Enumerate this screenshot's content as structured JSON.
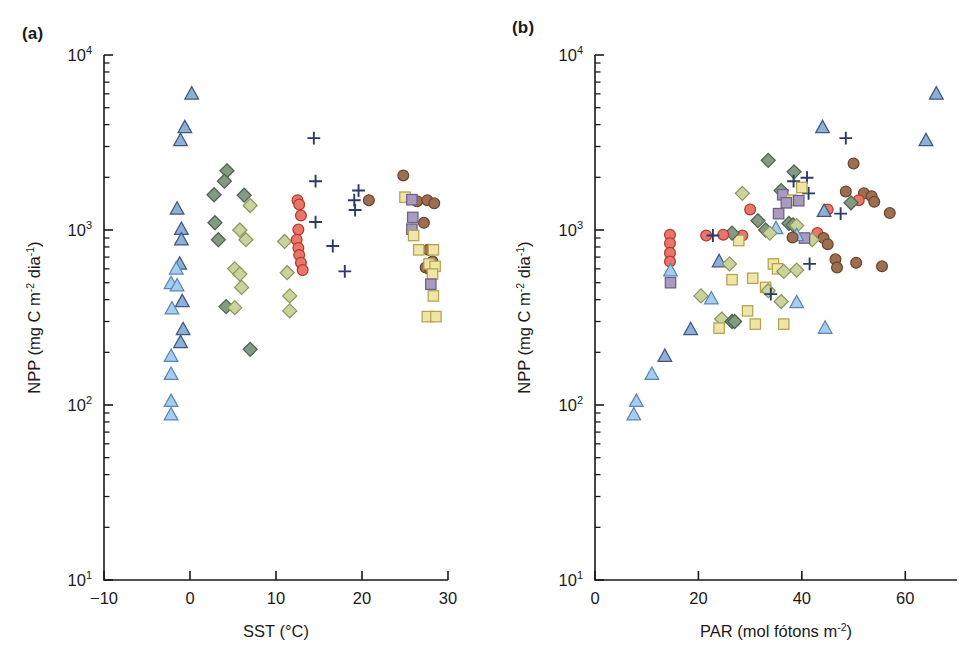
{
  "figure": {
    "background": "#ffffff",
    "panels": [
      {
        "id": "a",
        "label": "(a)"
      },
      {
        "id": "b",
        "label": "(b)"
      }
    ]
  },
  "marker_styles": {
    "triangle_light": {
      "name": "light-blue-triangle",
      "shape": "triangle",
      "fill": "#a5cdee",
      "stroke": "#5d86b5"
    },
    "triangle_dark": {
      "name": "steel-blue-triangle",
      "shape": "triangle",
      "fill": "#8fb0d6",
      "stroke": "#40587f"
    },
    "diamond_olive": {
      "name": "olive-diamond",
      "shape": "diamond",
      "fill": "#ccd39a",
      "stroke": "#8f9560"
    },
    "diamond_green": {
      "name": "dark-green-diamond",
      "shape": "diamond",
      "fill": "#849a82",
      "stroke": "#4d6450"
    },
    "circle_red": {
      "name": "red-circle",
      "shape": "circle",
      "fill": "#e8766a",
      "stroke": "#b03b2e"
    },
    "circle_brown": {
      "name": "brown-circle",
      "shape": "circle",
      "fill": "#9c6f52",
      "stroke": "#6b452d"
    },
    "square_yellow": {
      "name": "yellow-square",
      "shape": "square",
      "fill": "#eee5a6",
      "stroke": "#b3a martial"
    },
    "square_purple": {
      "name": "purple-square",
      "shape": "square",
      "fill": "#a99bc0",
      "stroke": "#6d5f86"
    },
    "plus_navy": {
      "name": "navy-plus",
      "shape": "plus",
      "fill": "none",
      "stroke": "#2b3a66"
    }
  },
  "chart_data": [
    {
      "id": "a",
      "type": "scatter",
      "title": "",
      "panel_label": "(a)",
      "xlabel": "SST (°C)",
      "xlabel_parts": {
        "text": "SST (",
        "unit": "°C",
        "close": ")"
      },
      "ylabel": "NPP (mg C m⁻² dia⁻¹)",
      "ylabel_parts": {
        "lead": "NPP (mg C m",
        "sup1": "-2",
        "mid": " dia",
        "sup2": "-1",
        "close": ")"
      },
      "xlim": [
        -10,
        30
      ],
      "ylim": [
        10,
        10000
      ],
      "yscale": "log",
      "xticks": [
        -10,
        0,
        10,
        20,
        30
      ],
      "xticklabels": [
        "−10",
        "0",
        "10",
        "20",
        "30"
      ],
      "yticks": [
        10,
        100,
        1000,
        10000
      ],
      "yticklabels": [
        "10¹",
        "10²",
        "10³",
        "10⁴"
      ],
      "yticklabel_parts": [
        {
          "base": "10",
          "exp": "1"
        },
        {
          "base": "10",
          "exp": "2"
        },
        {
          "base": "10",
          "exp": "3"
        },
        {
          "base": "10",
          "exp": "4"
        }
      ],
      "grid": false,
      "legend": false,
      "points": [
        {
          "x": 0.2,
          "y": 6000,
          "m": "triangle_dark"
        },
        {
          "x": -0.6,
          "y": 3850,
          "m": "triangle_dark"
        },
        {
          "x": -1.1,
          "y": 3250,
          "m": "triangle_dark"
        },
        {
          "x": -1.5,
          "y": 1320,
          "m": "triangle_dark"
        },
        {
          "x": -1.0,
          "y": 1010,
          "m": "triangle_dark"
        },
        {
          "x": -1.0,
          "y": 880,
          "m": "triangle_dark"
        },
        {
          "x": -1.2,
          "y": 640,
          "m": "triangle_dark"
        },
        {
          "x": -1.6,
          "y": 600,
          "m": "triangle_light"
        },
        {
          "x": -2.2,
          "y": 495,
          "m": "triangle_light"
        },
        {
          "x": -1.5,
          "y": 480,
          "m": "triangle_light"
        },
        {
          "x": -0.9,
          "y": 390,
          "m": "triangle_dark"
        },
        {
          "x": -2.1,
          "y": 355,
          "m": "triangle_light"
        },
        {
          "x": -0.8,
          "y": 270,
          "m": "triangle_dark"
        },
        {
          "x": -1.1,
          "y": 228,
          "m": "triangle_dark"
        },
        {
          "x": -2.2,
          "y": 190,
          "m": "triangle_light"
        },
        {
          "x": -2.2,
          "y": 150,
          "m": "triangle_light"
        },
        {
          "x": -2.2,
          "y": 105,
          "m": "triangle_light"
        },
        {
          "x": -2.2,
          "y": 88,
          "m": "triangle_light"
        },
        {
          "x": 4.3,
          "y": 2180,
          "m": "diamond_green"
        },
        {
          "x": 4.0,
          "y": 1900,
          "m": "diamond_green"
        },
        {
          "x": 2.8,
          "y": 1590,
          "m": "diamond_green"
        },
        {
          "x": 6.3,
          "y": 1580,
          "m": "diamond_green"
        },
        {
          "x": 7.0,
          "y": 1380,
          "m": "diamond_olive"
        },
        {
          "x": 2.9,
          "y": 1100,
          "m": "diamond_green"
        },
        {
          "x": 5.8,
          "y": 1000,
          "m": "diamond_olive"
        },
        {
          "x": 3.3,
          "y": 880,
          "m": "diamond_green"
        },
        {
          "x": 6.5,
          "y": 880,
          "m": "diamond_olive"
        },
        {
          "x": 5.2,
          "y": 600,
          "m": "diamond_olive"
        },
        {
          "x": 5.8,
          "y": 560,
          "m": "diamond_olive"
        },
        {
          "x": 6.0,
          "y": 470,
          "m": "diamond_olive"
        },
        {
          "x": 4.2,
          "y": 365,
          "m": "diamond_green"
        },
        {
          "x": 5.2,
          "y": 360,
          "m": "diamond_olive"
        },
        {
          "x": 7.0,
          "y": 208,
          "m": "diamond_green"
        },
        {
          "x": 11.0,
          "y": 860,
          "m": "diamond_olive"
        },
        {
          "x": 11.3,
          "y": 570,
          "m": "diamond_olive"
        },
        {
          "x": 11.6,
          "y": 420,
          "m": "diamond_olive"
        },
        {
          "x": 11.6,
          "y": 345,
          "m": "diamond_olive"
        },
        {
          "x": 12.5,
          "y": 1480,
          "m": "circle_red"
        },
        {
          "x": 12.7,
          "y": 1400,
          "m": "circle_red"
        },
        {
          "x": 12.9,
          "y": 1210,
          "m": "circle_red"
        },
        {
          "x": 12.6,
          "y": 1005,
          "m": "circle_red"
        },
        {
          "x": 12.4,
          "y": 880,
          "m": "circle_red"
        },
        {
          "x": 12.6,
          "y": 790,
          "m": "circle_red"
        },
        {
          "x": 12.7,
          "y": 720,
          "m": "circle_red"
        },
        {
          "x": 12.9,
          "y": 650,
          "m": "circle_red"
        },
        {
          "x": 13.1,
          "y": 590,
          "m": "circle_red"
        },
        {
          "x": 14.4,
          "y": 3350,
          "m": "plus_navy"
        },
        {
          "x": 14.6,
          "y": 1900,
          "m": "plus_navy"
        },
        {
          "x": 14.6,
          "y": 1110,
          "m": "plus_navy"
        },
        {
          "x": 19.6,
          "y": 1680,
          "m": "plus_navy"
        },
        {
          "x": 19.1,
          "y": 1480,
          "m": "plus_navy"
        },
        {
          "x": 19.2,
          "y": 1300,
          "m": "plus_navy"
        },
        {
          "x": 16.6,
          "y": 810,
          "m": "plus_navy"
        },
        {
          "x": 18.0,
          "y": 580,
          "m": "plus_navy"
        },
        {
          "x": 20.8,
          "y": 1480,
          "m": "circle_brown"
        },
        {
          "x": 24.8,
          "y": 2050,
          "m": "circle_brown"
        },
        {
          "x": 26.4,
          "y": 1460,
          "m": "circle_brown"
        },
        {
          "x": 27.6,
          "y": 1480,
          "m": "circle_brown"
        },
        {
          "x": 28.4,
          "y": 1420,
          "m": "circle_brown"
        },
        {
          "x": 27.2,
          "y": 1100,
          "m": "circle_brown"
        },
        {
          "x": 27.7,
          "y": 770,
          "m": "circle_brown"
        },
        {
          "x": 27.4,
          "y": 610,
          "m": "circle_brown"
        },
        {
          "x": 27.9,
          "y": 595,
          "m": "circle_brown"
        },
        {
          "x": 28.2,
          "y": 660,
          "m": "circle_brown"
        },
        {
          "x": 25.0,
          "y": 1540,
          "m": "square_yellow"
        },
        {
          "x": 25.8,
          "y": 1490,
          "m": "square_purple"
        },
        {
          "x": 25.9,
          "y": 1180,
          "m": "square_purple"
        },
        {
          "x": 25.8,
          "y": 1010,
          "m": "square_purple"
        },
        {
          "x": 26.0,
          "y": 930,
          "m": "square_yellow"
        },
        {
          "x": 26.6,
          "y": 770,
          "m": "square_yellow"
        },
        {
          "x": 28.3,
          "y": 770,
          "m": "square_yellow"
        },
        {
          "x": 27.8,
          "y": 640,
          "m": "square_yellow"
        },
        {
          "x": 28.5,
          "y": 620,
          "m": "square_yellow"
        },
        {
          "x": 28.2,
          "y": 560,
          "m": "square_yellow"
        },
        {
          "x": 28.0,
          "y": 490,
          "m": "square_purple"
        },
        {
          "x": 28.3,
          "y": 420,
          "m": "square_yellow"
        },
        {
          "x": 27.6,
          "y": 320,
          "m": "square_yellow"
        },
        {
          "x": 28.6,
          "y": 320,
          "m": "square_yellow"
        }
      ]
    },
    {
      "id": "b",
      "type": "scatter",
      "title": "",
      "panel_label": "(b)",
      "xlabel": "PAR (mol fótons m⁻²)",
      "xlabel_parts": {
        "lead": "PAR (mol fótons m",
        "sup": "-2",
        "close": ")"
      },
      "ylabel": "NPP (mg C m⁻² dia⁻¹)",
      "ylabel_parts": {
        "lead": "NPP (mg C m",
        "sup1": "-2",
        "mid": " dia",
        "sup2": "-1",
        "close": ")"
      },
      "xlim": [
        0,
        70
      ],
      "ylim": [
        10,
        10000
      ],
      "yscale": "log",
      "xticks": [
        0,
        20,
        40,
        60
      ],
      "xticklabels": [
        "0",
        "20",
        "40",
        "60"
      ],
      "yticks": [
        10,
        100,
        1000,
        10000
      ],
      "yticklabels": [
        "10¹",
        "10²",
        "10³",
        "10⁴"
      ],
      "yticklabel_parts": [
        {
          "base": "10",
          "exp": "1"
        },
        {
          "base": "10",
          "exp": "2"
        },
        {
          "base": "10",
          "exp": "3"
        },
        {
          "base": "10",
          "exp": "4"
        }
      ],
      "grid": false,
      "legend": false,
      "points": [
        {
          "x": 66.0,
          "y": 6000,
          "m": "triangle_dark"
        },
        {
          "x": 44.0,
          "y": 3850,
          "m": "triangle_dark"
        },
        {
          "x": 64.0,
          "y": 3250,
          "m": "triangle_dark"
        },
        {
          "x": 48.5,
          "y": 3350,
          "m": "plus_navy"
        },
        {
          "x": 33.5,
          "y": 2500,
          "m": "diamond_green"
        },
        {
          "x": 38.5,
          "y": 2150,
          "m": "diamond_green"
        },
        {
          "x": 28.5,
          "y": 1620,
          "m": "diamond_olive"
        },
        {
          "x": 36.0,
          "y": 1680,
          "m": "diamond_green"
        },
        {
          "x": 36.3,
          "y": 1590,
          "m": "square_purple"
        },
        {
          "x": 38.4,
          "y": 1900,
          "m": "plus_navy"
        },
        {
          "x": 41.0,
          "y": 1990,
          "m": "plus_navy"
        },
        {
          "x": 41.3,
          "y": 1620,
          "m": "plus_navy"
        },
        {
          "x": 40.0,
          "y": 1750,
          "m": "square_yellow"
        },
        {
          "x": 38.0,
          "y": 1480,
          "m": "square_yellow"
        },
        {
          "x": 39.4,
          "y": 1470,
          "m": "square_purple"
        },
        {
          "x": 37.0,
          "y": 1430,
          "m": "square_purple"
        },
        {
          "x": 50.0,
          "y": 2400,
          "m": "circle_brown"
        },
        {
          "x": 48.5,
          "y": 1660,
          "m": "circle_brown"
        },
        {
          "x": 52.0,
          "y": 1620,
          "m": "circle_brown"
        },
        {
          "x": 53.5,
          "y": 1560,
          "m": "circle_brown"
        },
        {
          "x": 54.0,
          "y": 1450,
          "m": "circle_brown"
        },
        {
          "x": 51.0,
          "y": 1480,
          "m": "circle_red"
        },
        {
          "x": 57.0,
          "y": 1250,
          "m": "circle_brown"
        },
        {
          "x": 45.0,
          "y": 1310,
          "m": "circle_red"
        },
        {
          "x": 44.3,
          "y": 1280,
          "m": "triangle_dark"
        },
        {
          "x": 47.5,
          "y": 1240,
          "m": "plus_navy"
        },
        {
          "x": 49.5,
          "y": 1430,
          "m": "diamond_green"
        },
        {
          "x": 30.0,
          "y": 1310,
          "m": "circle_red"
        },
        {
          "x": 35.5,
          "y": 1240,
          "m": "square_purple"
        },
        {
          "x": 31.5,
          "y": 1130,
          "m": "diamond_green"
        },
        {
          "x": 37.5,
          "y": 1090,
          "m": "diamond_green"
        },
        {
          "x": 38.3,
          "y": 1070,
          "m": "diamond_green"
        },
        {
          "x": 39.0,
          "y": 1060,
          "m": "diamond_olive"
        },
        {
          "x": 35.0,
          "y": 1020,
          "m": "triangle_light"
        },
        {
          "x": 33.0,
          "y": 1000,
          "m": "diamond_green"
        },
        {
          "x": 33.8,
          "y": 960,
          "m": "diamond_olive"
        },
        {
          "x": 28.5,
          "y": 930,
          "m": "circle_red"
        },
        {
          "x": 27.8,
          "y": 870,
          "m": "square_yellow"
        },
        {
          "x": 26.5,
          "y": 960,
          "m": "diamond_green"
        },
        {
          "x": 24.8,
          "y": 940,
          "m": "circle_red"
        },
        {
          "x": 21.5,
          "y": 930,
          "m": "circle_red"
        },
        {
          "x": 22.8,
          "y": 930,
          "m": "plus_navy"
        },
        {
          "x": 43.0,
          "y": 960,
          "m": "circle_red"
        },
        {
          "x": 44.2,
          "y": 900,
          "m": "circle_brown"
        },
        {
          "x": 42.0,
          "y": 880,
          "m": "diamond_olive"
        },
        {
          "x": 45.0,
          "y": 830,
          "m": "circle_brown"
        },
        {
          "x": 40.5,
          "y": 900,
          "m": "square_purple"
        },
        {
          "x": 39.0,
          "y": 930,
          "m": "triangle_light"
        },
        {
          "x": 38.2,
          "y": 905,
          "m": "circle_brown"
        },
        {
          "x": 14.5,
          "y": 940,
          "m": "circle_red"
        },
        {
          "x": 14.5,
          "y": 840,
          "m": "circle_red"
        },
        {
          "x": 14.5,
          "y": 740,
          "m": "circle_red"
        },
        {
          "x": 14.5,
          "y": 660,
          "m": "circle_red"
        },
        {
          "x": 14.6,
          "y": 585,
          "m": "triangle_light"
        },
        {
          "x": 14.6,
          "y": 500,
          "m": "square_purple"
        },
        {
          "x": 46.5,
          "y": 680,
          "m": "circle_brown"
        },
        {
          "x": 46.8,
          "y": 610,
          "m": "circle_brown"
        },
        {
          "x": 50.5,
          "y": 650,
          "m": "circle_brown"
        },
        {
          "x": 55.5,
          "y": 620,
          "m": "circle_brown"
        },
        {
          "x": 24.0,
          "y": 660,
          "m": "triangle_dark"
        },
        {
          "x": 26.0,
          "y": 640,
          "m": "diamond_olive"
        },
        {
          "x": 41.5,
          "y": 640,
          "m": "plus_navy"
        },
        {
          "x": 34.5,
          "y": 640,
          "m": "square_yellow"
        },
        {
          "x": 35.3,
          "y": 600,
          "m": "square_yellow"
        },
        {
          "x": 36.5,
          "y": 580,
          "m": "diamond_olive"
        },
        {
          "x": 39.0,
          "y": 590,
          "m": "diamond_olive"
        },
        {
          "x": 26.5,
          "y": 520,
          "m": "square_yellow"
        },
        {
          "x": 30.5,
          "y": 530,
          "m": "square_yellow"
        },
        {
          "x": 33.0,
          "y": 470,
          "m": "square_yellow"
        },
        {
          "x": 33.5,
          "y": 450,
          "m": "diamond_olive"
        },
        {
          "x": 34.0,
          "y": 430,
          "m": "plus_navy"
        },
        {
          "x": 20.5,
          "y": 420,
          "m": "diamond_olive"
        },
        {
          "x": 22.5,
          "y": 405,
          "m": "triangle_light"
        },
        {
          "x": 36.0,
          "y": 390,
          "m": "diamond_olive"
        },
        {
          "x": 39.0,
          "y": 385,
          "m": "triangle_light"
        },
        {
          "x": 29.5,
          "y": 345,
          "m": "square_yellow"
        },
        {
          "x": 24.5,
          "y": 310,
          "m": "diamond_olive"
        },
        {
          "x": 26.5,
          "y": 300,
          "m": "diamond_green"
        },
        {
          "x": 27.0,
          "y": 300,
          "m": "diamond_green"
        },
        {
          "x": 31.0,
          "y": 290,
          "m": "square_yellow"
        },
        {
          "x": 24.0,
          "y": 275,
          "m": "square_yellow"
        },
        {
          "x": 36.5,
          "y": 290,
          "m": "square_yellow"
        },
        {
          "x": 44.5,
          "y": 275,
          "m": "triangle_light"
        },
        {
          "x": 18.5,
          "y": 270,
          "m": "triangle_dark"
        },
        {
          "x": 13.5,
          "y": 190,
          "m": "triangle_dark"
        },
        {
          "x": 11.0,
          "y": 150,
          "m": "triangle_light"
        },
        {
          "x": 8.0,
          "y": 105,
          "m": "triangle_light"
        },
        {
          "x": 7.5,
          "y": 88,
          "m": "triangle_light"
        }
      ]
    }
  ]
}
